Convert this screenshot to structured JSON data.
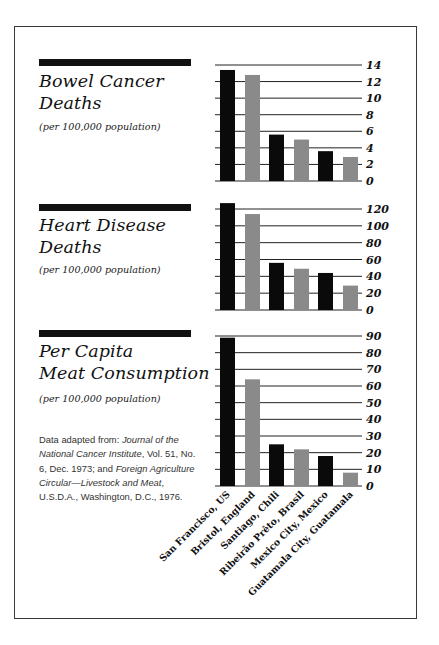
{
  "colors": {
    "primary_bar": "#0a0a0a",
    "secondary_bar": "#8a8a8a",
    "gridline": "#222222",
    "section_bar": "#111111"
  },
  "sections": [
    {
      "title_line1": "Bowel Cancer",
      "title_line2": "Deaths",
      "subtitle": "(per 100,000 population)"
    },
    {
      "title_line1": "Heart Disease",
      "title_line2": "Deaths",
      "subtitle": "(per 100,000 population)"
    },
    {
      "title_line1": "Per Capita",
      "title_line2": "Meat Consumption",
      "subtitle": "(per 100,000 population)"
    }
  ],
  "source": {
    "prefix": "Data adapted from: ",
    "journal": "Journal of the National Cancer Institute",
    "journal_details": ", Vol. 51, No. 6, Dec. 1973; and ",
    "circular": "Foreign Agriculture Circular—Livestock and Meat",
    "circular_details": ", U.S.D.A., Washington, D.C., 1976."
  },
  "chart_data": [
    {
      "type": "bar",
      "title": "Bowel Cancer Deaths",
      "subtitle": "(per 100,000 population)",
      "categories": [
        "San Francisco, US",
        "Bristol, England",
        "Santiago, Chili",
        "Ribeirão Prêto, Brasil",
        "Mexico City, Mexico",
        "Guatamala City, Guatamala"
      ],
      "values": [
        13.4,
        12.8,
        5.6,
        5.0,
        3.6,
        2.9
      ],
      "ylim": [
        0,
        14
      ],
      "yticks": [
        0,
        2,
        4,
        6,
        8,
        10,
        12,
        14
      ],
      "grid": true,
      "y_axis_position": "right",
      "bar_colors": [
        "#0a0a0a",
        "#8a8a8a",
        "#0a0a0a",
        "#8a8a8a",
        "#0a0a0a",
        "#8a8a8a"
      ]
    },
    {
      "type": "bar",
      "title": "Heart Disease Deaths",
      "subtitle": "(per 100,000 population)",
      "categories": [
        "San Francisco, US",
        "Bristol, England",
        "Santiago, Chili",
        "Ribeirão Prêto, Brasil",
        "Mexico City, Mexico",
        "Guatamala City, Guatamala"
      ],
      "values": [
        127,
        114,
        56,
        49,
        44,
        29
      ],
      "ylim": [
        0,
        120
      ],
      "yticks": [
        0,
        20,
        40,
        60,
        80,
        100,
        120
      ],
      "grid": true,
      "y_axis_position": "right",
      "bar_colors": [
        "#0a0a0a",
        "#8a8a8a",
        "#0a0a0a",
        "#8a8a8a",
        "#0a0a0a",
        "#8a8a8a"
      ]
    },
    {
      "type": "bar",
      "title": "Per Capita Meat Consumption",
      "subtitle": "(per 100,000 population)",
      "categories": [
        "San Francisco, US",
        "Bristol, England",
        "Santiago, Chili",
        "Ribeirão Prêto, Brasil",
        "Mexico City, Mexico",
        "Guatamala City, Guatamala"
      ],
      "values": [
        89,
        64,
        25,
        22,
        18,
        8
      ],
      "ylim": [
        0,
        90
      ],
      "yticks": [
        0,
        10,
        20,
        30,
        40,
        50,
        60,
        70,
        80,
        90
      ],
      "grid": true,
      "y_axis_position": "right",
      "xlabel_rotation": -45,
      "bar_colors": [
        "#0a0a0a",
        "#8a8a8a",
        "#0a0a0a",
        "#8a8a8a",
        "#0a0a0a",
        "#8a8a8a"
      ]
    }
  ]
}
